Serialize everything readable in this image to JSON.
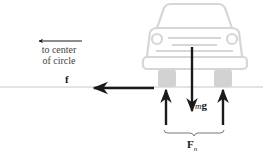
{
  "diagram": {
    "direction_label": {
      "line1": "to center",
      "line2": "of circle"
    },
    "forces": {
      "friction": {
        "label": "f",
        "direction": "left (toward center)"
      },
      "weight": {
        "label_prefix": "m",
        "label_vector": "g",
        "direction": "down"
      },
      "normal": {
        "label_vector": "F",
        "label_subscript": "n",
        "direction": "up",
        "count": 2
      }
    },
    "colors": {
      "car": "#d6d6d6",
      "arrow": "#1a1a1a",
      "ground": "#c8c8c8",
      "background": "#ffffff"
    }
  }
}
